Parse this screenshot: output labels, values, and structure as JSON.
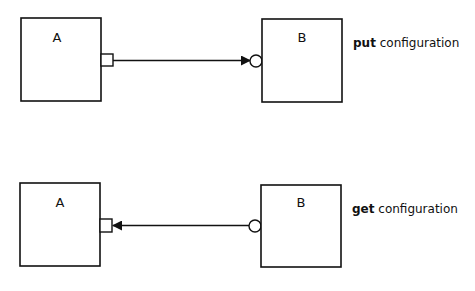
{
  "diagrams": [
    {
      "name": "put",
      "left_box": {
        "label": "A"
      },
      "right_box": {
        "label": "B"
      },
      "caption": {
        "keyword": "put",
        "rest": " configuration"
      },
      "arrow_direction": "A-to-B"
    },
    {
      "name": "get",
      "left_box": {
        "label": "A"
      },
      "right_box": {
        "label": "B"
      },
      "caption": {
        "keyword": "get",
        "rest": " configuration"
      },
      "arrow_direction": "B-to-A"
    }
  ],
  "colors": {
    "stroke": "#111111",
    "background": "#ffffff"
  }
}
